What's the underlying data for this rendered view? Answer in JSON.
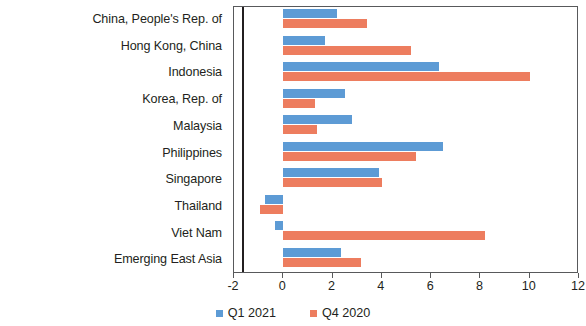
{
  "chart_data": {
    "type": "bar",
    "orientation": "horizontal",
    "title": "",
    "subtitle": "",
    "xlabel": "",
    "ylabel": "",
    "xlim": [
      -2,
      12
    ],
    "xticks": [
      -2,
      0,
      2,
      4,
      6,
      8,
      10,
      12
    ],
    "xtick_labels": [
      "-2",
      "0",
      "2",
      "4",
      "6",
      "8",
      "10",
      "12"
    ],
    "grid": false,
    "legend_position": "bottom",
    "categories": [
      "China, People's Rep. of",
      "Hong Kong, China",
      "Indonesia",
      "Korea, Rep. of",
      "Malaysia",
      "Philippines",
      "Singapore",
      "Thailand",
      "Viet Nam",
      "Emerging East Asia"
    ],
    "series": [
      {
        "name": "Q1 2021",
        "color": "#5d9bd5",
        "values": [
          2.2,
          1.7,
          6.3,
          2.5,
          2.8,
          6.5,
          3.9,
          -0.75,
          -0.35,
          2.35
        ]
      },
      {
        "name": "Q4 2020",
        "color": "#ed7d5f",
        "values": [
          3.4,
          5.2,
          10.0,
          1.3,
          1.35,
          5.4,
          4.0,
          -0.95,
          8.2,
          3.15
        ]
      }
    ]
  },
  "legend": {
    "items": [
      {
        "label": "Q1 2021",
        "color": "#5d9bd5"
      },
      {
        "label": "Q4 2020",
        "color": "#ed7d5f"
      }
    ]
  }
}
